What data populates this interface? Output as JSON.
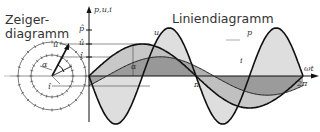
{
  "titles": {
    "phasor": "Zeiger-\ndiagramm",
    "phasor_line1": "Zeiger-",
    "phasor_line2": "diagramm",
    "line": "Liniendiagramm"
  },
  "axis": {
    "y_label": "p,u,i",
    "x_label": "ωt",
    "tick_pi": "π",
    "tick_2pi": "2π",
    "p_hat": "p̂",
    "u_hat": "û",
    "i_hat": "î",
    "alpha": "α"
  },
  "phasor": {
    "u_label": "û",
    "i_label": "î",
    "alpha": "α",
    "phi": "φ"
  },
  "curve_labels": {
    "u": "u",
    "i": "i",
    "p": "p"
  },
  "colors": {
    "line": "#111111",
    "fill_u": "#b8b8b8",
    "fill_i": "#8c8c8c",
    "fill_p": "#dedede",
    "grid": "#555555"
  },
  "chart_data": {
    "type": "line",
    "title": "Liniendiagramm",
    "xlabel": "ωt",
    "ylabel": "p,u,i",
    "x_ticks": [
      "π",
      "2π"
    ],
    "y_ticks": [
      "p̂",
      "û",
      "î"
    ],
    "series": [
      {
        "name": "u",
        "amplitude": 1.0,
        "phase_deg": 0
      },
      {
        "name": "i",
        "amplitude": 0.6,
        "phase_deg": -30
      },
      {
        "name": "p",
        "amplitude": 1.5,
        "frequency_multiplier": 2,
        "offset": 0.15
      }
    ],
    "xlim": [
      0,
      6.2832
    ],
    "grid": false
  }
}
